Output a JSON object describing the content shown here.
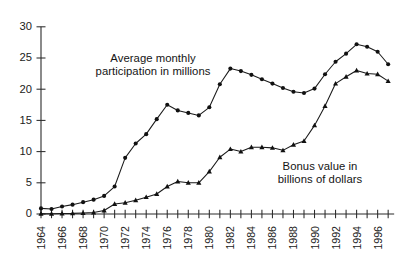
{
  "chart_data": {
    "type": "line",
    "title": "",
    "xlabel": "",
    "ylabel": "",
    "xlim": [
      1964,
      1997
    ],
    "ylim": [
      0,
      30
    ],
    "grid": false,
    "legend_position": "inline-annotations",
    "x_tick_labels": [
      "1964",
      "1966",
      "1968",
      "1970",
      "1972",
      "1974",
      "1976",
      "1978",
      "1980",
      "1982",
      "1984",
      "1986",
      "1988",
      "1990",
      "1992",
      "1994",
      "1996"
    ],
    "x_tick_years": [
      1964,
      1966,
      1968,
      1970,
      1972,
      1974,
      1976,
      1978,
      1980,
      1982,
      1984,
      1986,
      1988,
      1990,
      1992,
      1994,
      1996
    ],
    "x_minor_years": [
      1965,
      1967,
      1969,
      1971,
      1973,
      1975,
      1977,
      1979,
      1981,
      1983,
      1985,
      1987,
      1989,
      1991,
      1993,
      1995,
      1997
    ],
    "y_tick_labels": [
      "0",
      "5",
      "10",
      "15",
      "20",
      "25",
      "30"
    ],
    "y_tick_values": [
      0,
      5,
      10,
      15,
      20,
      25,
      30
    ],
    "x": [
      1964,
      1965,
      1966,
      1967,
      1968,
      1969,
      1970,
      1971,
      1972,
      1973,
      1974,
      1975,
      1976,
      1977,
      1978,
      1979,
      1980,
      1981,
      1982,
      1983,
      1984,
      1985,
      1986,
      1987,
      1988,
      1989,
      1990,
      1991,
      1992,
      1993,
      1994,
      1995,
      1996,
      1997
    ],
    "series": [
      {
        "name": "Average monthly participation in millions",
        "marker": "circle",
        "values": [
          0.9,
          0.8,
          1.2,
          1.5,
          1.9,
          2.3,
          2.9,
          4.4,
          9.0,
          11.3,
          12.8,
          15.2,
          17.5,
          16.6,
          16.2,
          15.8,
          17.1,
          20.8,
          23.3,
          22.9,
          22.3,
          21.6,
          20.9,
          20.2,
          19.6,
          19.4,
          20.1,
          22.4,
          24.4,
          25.7,
          27.2,
          26.8,
          26.0,
          24.0
        ]
      },
      {
        "name": "Bonus value in billions of dollars",
        "marker": "triangle",
        "values": [
          0.03,
          0.04,
          0.07,
          0.1,
          0.17,
          0.25,
          0.55,
          1.6,
          1.8,
          2.2,
          2.7,
          3.2,
          4.4,
          5.2,
          5.0,
          5.0,
          6.8,
          9.1,
          10.4,
          10.0,
          10.7,
          10.7,
          10.6,
          10.2,
          11.1,
          11.7,
          14.2,
          17.3,
          20.9,
          22.0,
          23.0,
          22.5,
          22.4,
          21.3
        ]
      }
    ],
    "annotations": [
      {
        "id": "participation",
        "text": "Average monthly\nparticipation in millions",
        "refers_to": "Average monthly participation in millions"
      },
      {
        "id": "bonus",
        "text": "Bonus value in\nbillions of dollars",
        "refers_to": "Bonus value in billions of dollars"
      }
    ],
    "colors": {
      "series": "#111111",
      "axis": "#2b2b2b",
      "background": "#ffffff",
      "text": "#141414"
    }
  }
}
